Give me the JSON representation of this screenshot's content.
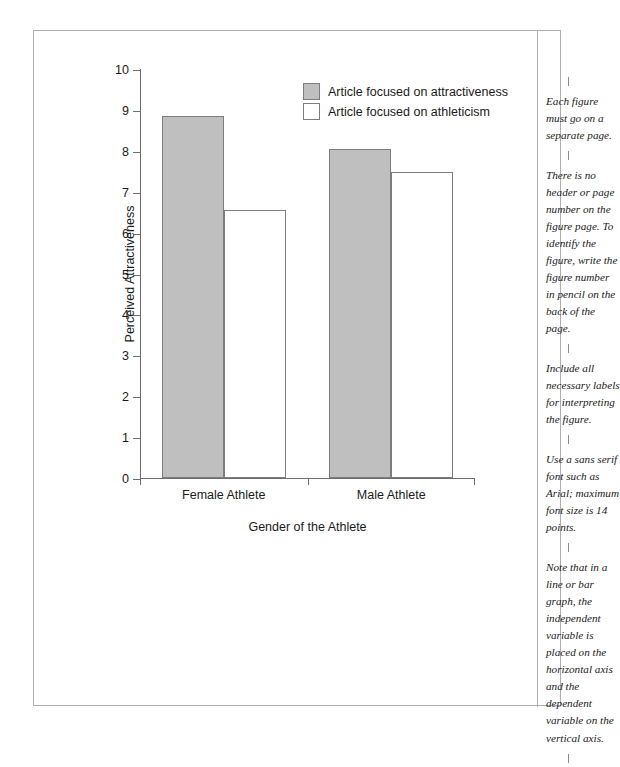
{
  "chart_data": {
    "type": "bar",
    "title": "",
    "xlabel": "Gender of the Athlete",
    "ylabel": "Perceived Attractiveness",
    "categories": [
      "Female Athlete",
      "Male Athlete"
    ],
    "series": [
      {
        "name": "Article focused on attractiveness",
        "values": [
          8.85,
          8.05
        ],
        "color": "#bfbfbf"
      },
      {
        "name": "Article focused on athleticism",
        "values": [
          6.55,
          7.47
        ],
        "color": "#ffffff"
      }
    ],
    "ylim": [
      0,
      10
    ],
    "yticks": [
      "0",
      "1",
      "2",
      "3",
      "4",
      "5",
      "6",
      "7",
      "8",
      "9",
      "10"
    ],
    "grid": false,
    "legend_position": "top-center"
  },
  "legend": {
    "items": [
      {
        "label": "Article focused on attractiveness",
        "swatch": "filled"
      },
      {
        "label": "Article focused on athleticism",
        "swatch": "open"
      }
    ]
  },
  "notes": [
    "Each figure must go on a separate page.",
    "There is no header or page number on the figure page. To identify the figure, write the figure number in pencil on the back of the page.",
    "Include all necessary labels for interpreting the figure.",
    "Use a sans serif font such as Arial; maximum font size is 14 points.",
    "Note that in a line or bar graph, the independent variable is placed on the horizontal axis and the dependent variable on the vertical axis."
  ]
}
